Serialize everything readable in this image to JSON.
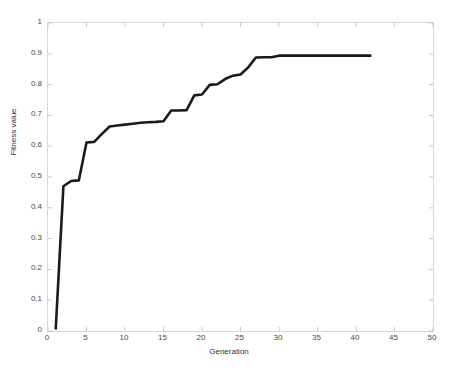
{
  "chart_data": {
    "type": "line",
    "title": "",
    "xlabel": "Generation",
    "ylabel": "Fitness value",
    "xlim": [
      0,
      50
    ],
    "ylim": [
      0,
      1
    ],
    "grid": false,
    "legend": null,
    "xticks": [
      0,
      5,
      10,
      15,
      20,
      25,
      30,
      35,
      40,
      45,
      50
    ],
    "xtick_labels": [
      "0",
      "5",
      "10",
      "15",
      "20",
      "25",
      "30",
      "35",
      "40",
      "45",
      "50"
    ],
    "yticks": [
      0,
      0.1,
      0.2,
      0.3,
      0.4,
      0.5,
      0.6,
      0.7,
      0.8,
      0.9,
      1
    ],
    "ytick_labels": [
      "0",
      "0.1",
      "0.2",
      "0.3",
      "0.4",
      "0.5",
      "0.6",
      "0.7",
      "0.8",
      "0.9",
      "1"
    ],
    "series": [
      {
        "name": "best fitness",
        "color": "#1a1a1a",
        "line_width": 2.6,
        "x": [
          1,
          2,
          3,
          4,
          5,
          6,
          7,
          8,
          9,
          10,
          11,
          12,
          13,
          14,
          15,
          16,
          17,
          18,
          19,
          20,
          21,
          22,
          23,
          24,
          25,
          26,
          27,
          28,
          29,
          30,
          31,
          32,
          33,
          34,
          35,
          36,
          37,
          38,
          39,
          40,
          41,
          42
        ],
        "values": [
          0.005,
          0.47,
          0.487,
          0.489,
          0.612,
          0.614,
          0.64,
          0.664,
          0.667,
          0.67,
          0.673,
          0.676,
          0.678,
          0.679,
          0.681,
          0.716,
          0.716,
          0.717,
          0.765,
          0.768,
          0.799,
          0.801,
          0.818,
          0.829,
          0.833,
          0.856,
          0.888,
          0.889,
          0.889,
          0.894,
          0.894,
          0.894,
          0.894,
          0.894,
          0.894,
          0.894,
          0.894,
          0.894,
          0.894,
          0.894,
          0.894,
          0.894
        ]
      }
    ]
  },
  "axes": {
    "frame_color": "#d8d8d8",
    "tick_color": "#c9c9c9",
    "text_color": "#4a4a4a"
  }
}
